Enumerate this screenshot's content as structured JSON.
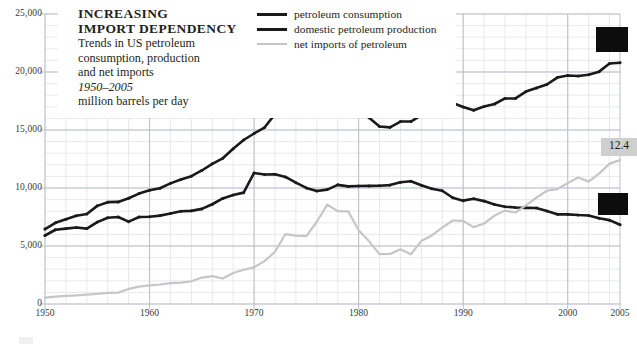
{
  "title": {
    "line1": "INCREASING",
    "line2": "IMPORT DEPENDENCY"
  },
  "subtitle": {
    "line1": "Trends in US petroleum",
    "line2": "consumption, production",
    "line3": "and net imports",
    "line4": "1950–2005",
    "line5": "million barrels per day"
  },
  "legend": {
    "position": "top-right-inset",
    "items": [
      {
        "label": "petroleum consumption",
        "color": "#1a1a1a",
        "weight": "thick"
      },
      {
        "label": "domestic petroleum production",
        "color": "#1a1a1a",
        "weight": "thick"
      },
      {
        "label": "net imports of petroleum",
        "color": "#c6c6c6",
        "weight": "thin"
      }
    ]
  },
  "end_labels": {
    "consumption": "",
    "imports": "12.4",
    "production": ""
  },
  "colors": {
    "consumption": "#1a1a1a",
    "production": "#1a1a1a",
    "imports": "#c6c6c6",
    "grid_major": "#b9bfc9",
    "grid_minor": "#dfe3e9",
    "text": "#231f20",
    "axis_text": "#3a3a3a",
    "redaction": "#0d0d0d",
    "value_box": "#cfcfcf"
  },
  "chart_data": {
    "type": "line",
    "title": "INCREASING IMPORT DEPENDENCY",
    "subtitle": "Trends in US petroleum consumption, production and net imports, 1950–2005",
    "xlabel": "",
    "ylabel": "million barrels per day",
    "xlim": [
      1950,
      2005
    ],
    "ylim": [
      0,
      25000
    ],
    "yticks": [
      0,
      5000,
      10000,
      15000,
      20000,
      25000
    ],
    "ytick_labels": [
      "0",
      "5,000",
      "10,000",
      "15,000",
      "20,000",
      "25,000"
    ],
    "xticks": [
      1950,
      1960,
      1970,
      1980,
      1990,
      2000,
      2005
    ],
    "xtick_labels": [
      "1950",
      "1960",
      "1970",
      "1980",
      "1990",
      "2000",
      "2005"
    ],
    "grid": true,
    "grid_step_x": 2,
    "grid_step_y": 1000,
    "x": [
      1950,
      1951,
      1952,
      1953,
      1954,
      1955,
      1956,
      1957,
      1958,
      1959,
      1960,
      1961,
      1962,
      1963,
      1964,
      1965,
      1966,
      1967,
      1968,
      1969,
      1970,
      1971,
      1972,
      1973,
      1974,
      1975,
      1976,
      1977,
      1978,
      1979,
      1980,
      1981,
      1982,
      1983,
      1984,
      1985,
      1986,
      1987,
      1988,
      1989,
      1990,
      1991,
      1992,
      1993,
      1994,
      1995,
      1996,
      1997,
      1998,
      1999,
      2000,
      2001,
      2002,
      2003,
      2004,
      2005
    ],
    "series": [
      {
        "name": "petroleum consumption",
        "color": "#1a1a1a",
        "values": [
          6458,
          7000,
          7300,
          7600,
          7760,
          8460,
          8780,
          8800,
          9120,
          9520,
          9800,
          9980,
          10400,
          10740,
          11020,
          11510,
          12080,
          12560,
          13390,
          14140,
          14700,
          15210,
          16370,
          17310,
          16650,
          16320,
          17460,
          18430,
          18850,
          18510,
          17060,
          16060,
          15300,
          15230,
          15730,
          15730,
          16280,
          16670,
          17280,
          17330,
          16990,
          16710,
          17030,
          17240,
          17720,
          17720,
          18310,
          18620,
          18920,
          19520,
          19700,
          19650,
          19760,
          20030,
          20730,
          20800
        ]
      },
      {
        "name": "domestic petroleum production",
        "color": "#1a1a1a",
        "values": [
          5906,
          6400,
          6500,
          6600,
          6500,
          7060,
          7440,
          7500,
          7100,
          7500,
          7520,
          7620,
          7800,
          8000,
          8030,
          8200,
          8600,
          9100,
          9400,
          9600,
          11300,
          11160,
          11180,
          10950,
          10460,
          10010,
          9740,
          9860,
          10270,
          10140,
          10170,
          10180,
          10200,
          10250,
          10500,
          10580,
          10230,
          9940,
          9760,
          9160,
          8910,
          9080,
          8870,
          8580,
          8390,
          8320,
          8290,
          8270,
          8010,
          7730,
          7730,
          7670,
          7630,
          7400,
          7230,
          6830
        ]
      },
      {
        "name": "net imports of petroleum",
        "color": "#c6c6c6",
        "values": [
          545,
          640,
          700,
          740,
          800,
          880,
          960,
          980,
          1300,
          1500,
          1610,
          1680,
          1800,
          1840,
          1960,
          2280,
          2400,
          2200,
          2670,
          2950,
          3160,
          3700,
          4500,
          6030,
          5890,
          5850,
          7090,
          8570,
          8000,
          7990,
          6360,
          5400,
          4300,
          4310,
          4720,
          4290,
          5440,
          5910,
          6590,
          7200,
          7160,
          6630,
          6940,
          7620,
          8050,
          7890,
          8500,
          9160,
          9760,
          9910,
          10420,
          10900,
          10550,
          11240,
          12100,
          12400
        ]
      }
    ],
    "annotations": [
      {
        "series": "net imports of petroleum",
        "at_x": 2005,
        "text": "12.4",
        "style": "grey-box"
      },
      {
        "series": "petroleum consumption",
        "at_x": 2005,
        "text": "",
        "style": "black-box-redacted"
      },
      {
        "series": "domestic petroleum production",
        "at_x": 2005,
        "text": "",
        "style": "black-box-redacted"
      }
    ]
  }
}
